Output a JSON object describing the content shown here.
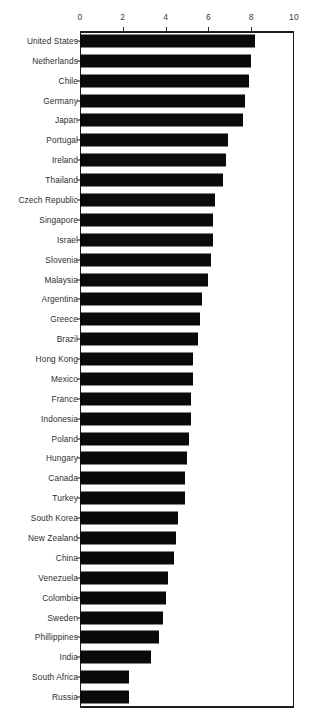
{
  "chart_data": {
    "type": "bar",
    "orientation": "horizontal",
    "title": "",
    "xlabel": "",
    "ylabel": "",
    "xlim": [
      0,
      10
    ],
    "xticks": [
      0,
      2,
      4,
      6,
      8,
      10
    ],
    "xtick_labels": [
      "0",
      "2",
      "4",
      "6",
      "8",
      "10"
    ],
    "grid": false,
    "legend": null,
    "bar_color": "#0a0a0a",
    "axis_color": "#1d1d1d",
    "categories": [
      "United States",
      "Netherlands",
      "Chile",
      "Germany",
      "Japan",
      "Portugal",
      "Ireland",
      "Thailand",
      "Czech Republic",
      "Singapore",
      "Israel",
      "Slovenia",
      "Malaysia",
      "Argentina",
      "Greece",
      "Brazil",
      "Hong Kong",
      "Mexico",
      "France",
      "Indonesia",
      "Poland",
      "Hungary",
      "Canada",
      "Turkey",
      "South Korea",
      "New Zealand",
      "China",
      "Venezuela",
      "Colombia",
      "Sweden",
      "Phillippines",
      "India",
      "South Africa",
      "Russia"
    ],
    "values": [
      8.2,
      8.0,
      7.9,
      7.7,
      7.6,
      6.9,
      6.8,
      6.7,
      6.3,
      6.2,
      6.2,
      6.1,
      6.0,
      5.7,
      5.6,
      5.5,
      5.3,
      5.3,
      5.2,
      5.2,
      5.1,
      5.0,
      4.9,
      4.9,
      4.6,
      4.5,
      4.4,
      4.1,
      4.0,
      3.9,
      3.7,
      3.3,
      2.3,
      2.3
    ]
  }
}
